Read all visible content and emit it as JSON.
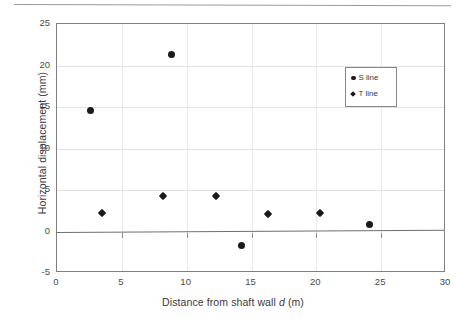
{
  "figure": {
    "top_rule_present": true
  },
  "legend": {
    "position": "inside-top-right",
    "entries": [
      {
        "label": "S line",
        "marker": "circle"
      },
      {
        "label": "T line",
        "marker": "diamond"
      }
    ]
  },
  "axes": {
    "x_title_prefix": "Distance from shaft wall ",
    "x_title_italic": "d",
    "x_title_suffix": " (m)",
    "y_title": "Horizontal displacement (mm)",
    "x_ticks": [
      "0",
      "5",
      "10",
      "15",
      "20",
      "25",
      "30"
    ],
    "y_ticks": [
      "25",
      "20",
      "15",
      "10",
      "5",
      "0",
      "-5"
    ]
  },
  "chart_data": {
    "type": "scatter",
    "title": "",
    "xlabel": "Distance from shaft wall d (m)",
    "ylabel": "Horizontal displacement (mm)",
    "xlim": [
      0,
      30
    ],
    "ylim": [
      -5,
      25
    ],
    "x_tick_values": [
      0,
      5,
      10,
      15,
      20,
      25,
      30
    ],
    "y_tick_values": [
      -5,
      0,
      5,
      10,
      15,
      20,
      25
    ],
    "grid": "both-light",
    "legend_position": "upper right inside",
    "zero_line": true,
    "series": [
      {
        "name": "S line",
        "marker": "circle",
        "color": "#1a1a1a",
        "points": [
          {
            "x": 2.6,
            "y": 14.6
          },
          {
            "x": 8.8,
            "y": 21.3
          },
          {
            "x": 14.2,
            "y": -1.7
          },
          {
            "x": 24.1,
            "y": 0.8
          }
        ]
      },
      {
        "name": "T line",
        "marker": "diamond",
        "color": "#1a1a1a",
        "points": [
          {
            "x": 3.5,
            "y": 2.2
          },
          {
            "x": 8.2,
            "y": 4.3
          },
          {
            "x": 12.3,
            "y": 4.3
          },
          {
            "x": 16.3,
            "y": 2.1
          },
          {
            "x": 20.3,
            "y": 2.2
          }
        ]
      }
    ]
  }
}
